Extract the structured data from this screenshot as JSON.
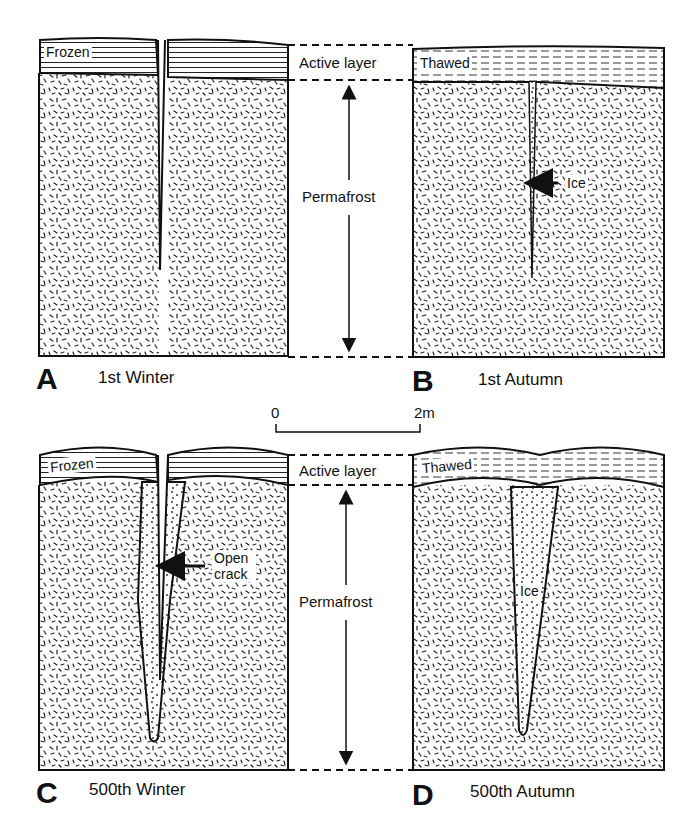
{
  "diagram": {
    "panels": [
      {
        "id": "A",
        "letter": "A",
        "caption": "1st Winter",
        "surface_label": "Frozen"
      },
      {
        "id": "B",
        "letter": "B",
        "caption": "1st Autumn",
        "surface_label": "Thawed",
        "annotation": "Ice"
      },
      {
        "id": "C",
        "letter": "C",
        "caption": "500th Winter",
        "surface_label": "Frozen",
        "annotation": "Open crack"
      },
      {
        "id": "D",
        "letter": "D",
        "caption": "500th Autumn",
        "surface_label": "Thawed",
        "annotation": "Ice"
      }
    ],
    "middle_labels": {
      "top_active_layer": "Active layer",
      "top_permafrost": "Permafrost",
      "bottom_active_layer": "Active layer",
      "bottom_permafrost": "Permafrost"
    },
    "scale_bar": {
      "start": "0",
      "end": "2m"
    },
    "colors": {
      "ink": "#111111",
      "background": "#ffffff"
    }
  }
}
